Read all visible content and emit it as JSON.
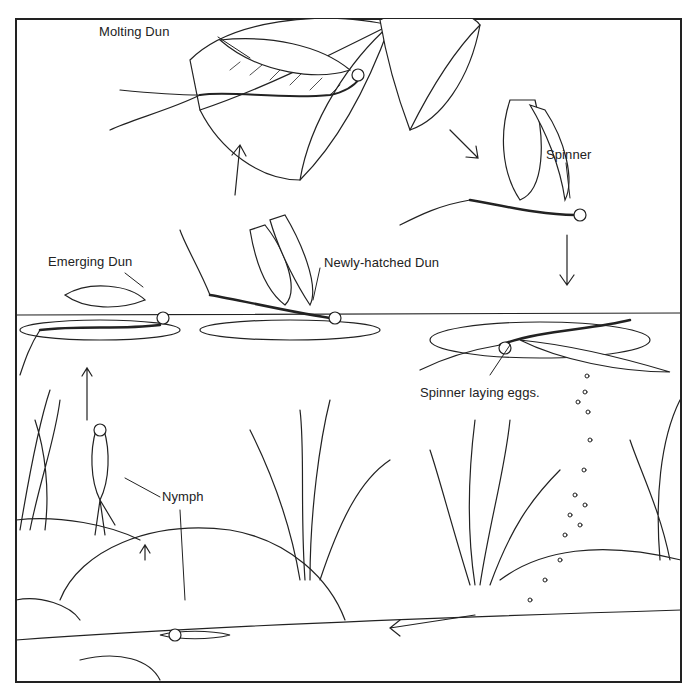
{
  "diagram": {
    "type": "mayfly life cycle illustration",
    "labels": {
      "molting_dun": "Molting Dun",
      "spinner": "Spinner",
      "emerging_dun": "Emerging Dun",
      "newly_hatched_dun": "Newly-hatched Dun",
      "spinner_laying_eggs": "Spinner laying eggs.",
      "nymph": "Nymph"
    },
    "colors": {
      "ink": "#222222",
      "paper": "#ffffff"
    }
  }
}
